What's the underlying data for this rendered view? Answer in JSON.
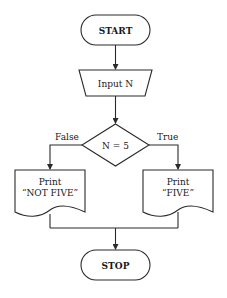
{
  "flowchart": {
    "start": {
      "label": "START",
      "shape": "terminator"
    },
    "input": {
      "label": "Input N",
      "shape": "manual-input"
    },
    "decision": {
      "label": "N = 5",
      "shape": "diamond"
    },
    "branches": {
      "false_label": "False",
      "true_label": "True"
    },
    "print_not_five": {
      "line1": "Print",
      "line2": "“NOT FIVE”",
      "shape": "document"
    },
    "print_five": {
      "line1": "Print",
      "line2": "“FIVE”",
      "shape": "document"
    },
    "stop": {
      "label": "STOP",
      "shape": "terminator"
    },
    "colors": {
      "stroke": "#2a2a2a",
      "fill": "#ffffff",
      "text": "#1a1a1a"
    }
  }
}
